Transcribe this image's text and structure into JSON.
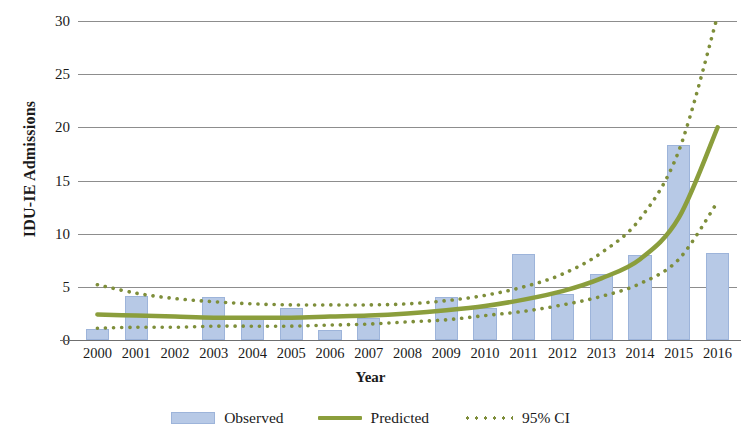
{
  "chart_data": {
    "type": "bar",
    "title": "",
    "xlabel": "Year",
    "ylabel": "IDU-IE Admissions",
    "categories": [
      "2000",
      "2001",
      "2002",
      "2003",
      "2004",
      "2005",
      "2006",
      "2007",
      "2008",
      "2009",
      "2010",
      "2011",
      "2012",
      "2013",
      "2014",
      "2015",
      "2016"
    ],
    "values": [
      1.0,
      4.1,
      0,
      4.0,
      2.1,
      3.0,
      0.9,
      2.1,
      0,
      4.0,
      3.0,
      8.1,
      4.3,
      6.2,
      8.0,
      18.3,
      8.2
    ],
    "ylim": [
      0,
      30
    ],
    "yticks": [
      0,
      5,
      10,
      15,
      20,
      25,
      30
    ],
    "grid": true,
    "legend_position": "bottom",
    "series": [
      {
        "name": "Observed",
        "kind": "bar",
        "color": "#b7c9e6",
        "values": [
          1.0,
          4.1,
          0,
          4.0,
          2.1,
          3.0,
          0.9,
          2.1,
          0,
          4.0,
          3.0,
          8.1,
          4.3,
          6.2,
          8.0,
          18.3,
          8.2
        ]
      },
      {
        "name": "Predicted",
        "kind": "line",
        "color": "#8b9e3c",
        "values": [
          2.4,
          2.3,
          2.2,
          2.1,
          2.1,
          2.1,
          2.2,
          2.3,
          2.5,
          2.8,
          3.2,
          3.8,
          4.6,
          5.8,
          7.6,
          11.5,
          20.0
        ]
      },
      {
        "name": "95% CI",
        "kind": "dotted-upper",
        "color": "#7e8e3a",
        "values": [
          5.2,
          4.4,
          3.9,
          3.6,
          3.4,
          3.3,
          3.3,
          3.3,
          3.4,
          3.7,
          4.2,
          5.0,
          6.2,
          8.2,
          11.4,
          17.8,
          30.5
        ]
      },
      {
        "name": "95% CI",
        "kind": "dotted-lower",
        "color": "#7e8e3a",
        "values": [
          1.1,
          1.2,
          1.2,
          1.3,
          1.3,
          1.3,
          1.4,
          1.5,
          1.7,
          1.9,
          2.3,
          2.7,
          3.3,
          4.1,
          5.3,
          7.6,
          13.0
        ]
      }
    ]
  },
  "axes": {
    "y_title": "IDU-IE Admissions",
    "x_title": "Year",
    "y_tick_labels": [
      "30",
      "25",
      "20",
      "15",
      "10",
      "5",
      "0"
    ],
    "x_tick_labels": [
      "2000",
      "2001",
      "2002",
      "2003",
      "2004",
      "2005",
      "2006",
      "2007",
      "2008",
      "2009",
      "2010",
      "2011",
      "2012",
      "2013",
      "2014",
      "2015",
      "2016"
    ]
  },
  "legend": {
    "items": [
      {
        "label": "Observed",
        "marker": "bar-swatch",
        "color": "#b7c9e6"
      },
      {
        "label": "Predicted",
        "marker": "solid-line",
        "color": "#8b9e3c"
      },
      {
        "label": "95% CI",
        "marker": "dotted-line",
        "color": "#7e8e3a"
      }
    ]
  },
  "colors": {
    "bar_fill": "#b7c9e6",
    "bar_stroke": "#9db4da",
    "predicted_line": "#8b9e3c",
    "ci_line": "#7e8e3a",
    "gridline": "#8d8d8d",
    "axis_line": "#6f6f6f",
    "text": "#1a1a1a"
  }
}
